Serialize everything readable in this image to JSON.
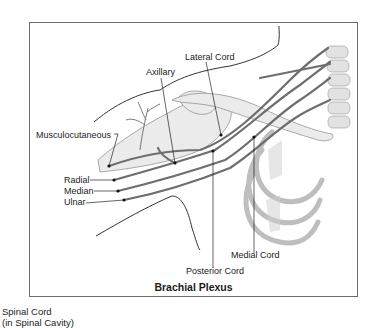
{
  "diagram": {
    "title": "Brachial Plexus",
    "frame_color": "#6b6b6b",
    "nerve_color": "#6e6e6e",
    "labels": {
      "musculocutaneous": "Musculocutaneous",
      "axillary": "Axillary",
      "lateral_cord": "Lateral Cord",
      "radial": "Radial",
      "median": "Median",
      "ulnar": "Ulnar",
      "medial_cord": "Medial Cord",
      "posterior_cord": "Posterior Cord"
    }
  },
  "caption": {
    "line1": "Spinal Cord",
    "line2": "(in Spinal Cavity)"
  }
}
